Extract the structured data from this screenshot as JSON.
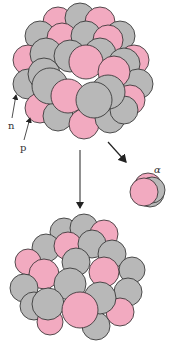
{
  "diagram": {
    "type": "alpha-decay",
    "labels": {
      "neutron": "n",
      "proton": "p",
      "alpha": "α"
    },
    "colors": {
      "proton": "#f2aac0",
      "neutron": "#b8b8b8",
      "outline": "#2a2a2a",
      "arrow": "#222222"
    },
    "nodes": [
      {
        "id": "parent-nucleus",
        "label": "parent nucleus"
      },
      {
        "id": "alpha-particle",
        "label": "α"
      },
      {
        "id": "daughter-nucleus",
        "label": "daughter nucleus"
      }
    ],
    "edges": [
      {
        "from": "parent-nucleus",
        "to": "daughter-nucleus"
      },
      {
        "from": "parent-nucleus",
        "to": "alpha-particle"
      }
    ]
  }
}
